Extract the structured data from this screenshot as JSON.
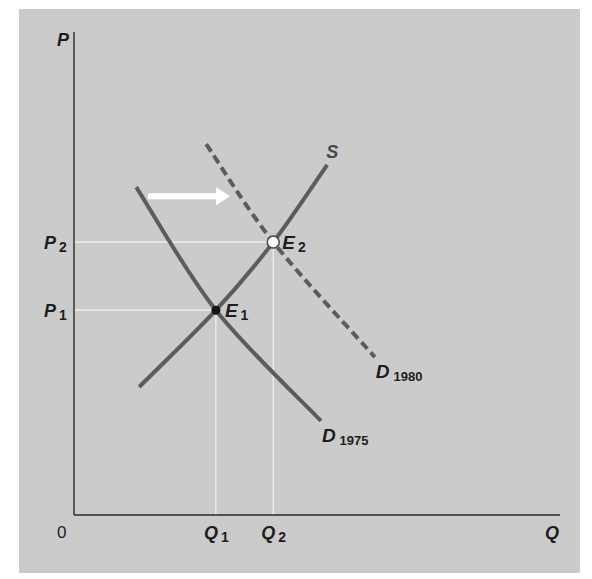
{
  "chart_data": {
    "type": "line",
    "title": "",
    "xlabel": "Q",
    "ylabel": "P",
    "origin_label": "0",
    "xlim": [
      0,
      10
    ],
    "ylim": [
      0,
      10
    ],
    "grid": false,
    "colors": {
      "panel": "#cbcbcb",
      "curve": "#5c5c5c",
      "axis": "#2a2a2a",
      "guide": "#f2f2f2",
      "arrow": "#ffffff",
      "text": "#1e1e1e"
    },
    "series": [
      {
        "name": "S",
        "label": "S",
        "label_sub": "",
        "style": "solid",
        "points": [
          [
            1.34,
            2.65
          ],
          [
            2.92,
            4.24
          ],
          [
            4.1,
            5.65
          ],
          [
            5.21,
            7.25
          ]
        ]
      },
      {
        "name": "D1975",
        "label": "D",
        "label_sub": "1975",
        "style": "solid",
        "points": [
          [
            1.28,
            6.79
          ],
          [
            2.92,
            4.24
          ],
          [
            5.08,
            1.95
          ]
        ]
      },
      {
        "name": "D1980",
        "label": "D",
        "label_sub": "1980",
        "style": "dashed",
        "points": [
          [
            2.72,
            7.68
          ],
          [
            4.1,
            5.65
          ],
          [
            6.19,
            3.27
          ]
        ]
      }
    ],
    "equilibria": [
      {
        "name": "E1",
        "label": "E",
        "label_sub": "1",
        "q": 2.92,
        "p": 4.24,
        "marker": "filled"
      },
      {
        "name": "E2",
        "label": "E",
        "label_sub": "2",
        "q": 4.1,
        "p": 5.65,
        "marker": "open"
      }
    ],
    "x_ticks": [
      {
        "value": 2.92,
        "label": "Q",
        "label_sub": "1"
      },
      {
        "value": 4.1,
        "label": "Q",
        "label_sub": "2"
      }
    ],
    "y_ticks": [
      {
        "value": 4.24,
        "label": "P",
        "label_sub": "1"
      },
      {
        "value": 5.65,
        "label": "P",
        "label_sub": "2"
      }
    ],
    "annotations": [
      {
        "type": "arrow",
        "from": [
          1.52,
          6.6
        ],
        "to": [
          3.21,
          6.6
        ],
        "meaning": "demand shift right"
      }
    ]
  }
}
